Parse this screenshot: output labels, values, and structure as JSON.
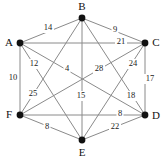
{
  "figure": {
    "type": "weighted-complete-graph",
    "vertex_count": 6,
    "edge_count": 15,
    "background_color": "#ffffff",
    "edge_color": "#8a8a8a",
    "node_color": "#111111",
    "label_color": "#1a1a1a"
  },
  "vertices": [
    {
      "id": "A",
      "label": "A",
      "x": 20,
      "y": 43,
      "label_x": 9,
      "label_y": 43
    },
    {
      "id": "B",
      "label": "B",
      "x": 82,
      "y": 18,
      "label_x": 82,
      "label_y": 7
    },
    {
      "id": "C",
      "label": "C",
      "x": 145,
      "y": 43,
      "label_x": 156,
      "label_y": 43
    },
    {
      "id": "D",
      "label": "D",
      "x": 145,
      "y": 115,
      "label_x": 156,
      "label_y": 116
    },
    {
      "id": "E",
      "label": "E",
      "x": 82,
      "y": 140,
      "label_x": 82,
      "label_y": 153
    },
    {
      "id": "F",
      "label": "F",
      "x": 20,
      "y": 115,
      "label_x": 9,
      "label_y": 115
    }
  ],
  "edges": [
    {
      "from": "A",
      "to": "B",
      "weight": "14",
      "label_x": 48,
      "label_y": 28
    },
    {
      "from": "B",
      "to": "C",
      "weight": "9",
      "label_x": 115,
      "label_y": 30
    },
    {
      "from": "A",
      "to": "C",
      "weight": "21",
      "label_x": 121,
      "label_y": 42
    },
    {
      "from": "A",
      "to": "F",
      "weight": "10",
      "label_x": 13,
      "label_y": 78
    },
    {
      "from": "C",
      "to": "D",
      "weight": "17",
      "label_x": 150,
      "label_y": 79
    },
    {
      "from": "F",
      "to": "D",
      "weight": "8",
      "label_x": 120,
      "label_y": 114
    },
    {
      "from": "F",
      "to": "E",
      "weight": "8",
      "label_x": 47,
      "label_y": 127
    },
    {
      "from": "E",
      "to": "D",
      "weight": "22",
      "label_x": 115,
      "label_y": 127
    },
    {
      "from": "B",
      "to": "E",
      "weight": "15",
      "label_x": 81,
      "label_y": 96
    },
    {
      "from": "A",
      "to": "D",
      "weight": "12",
      "label_x": 34,
      "label_y": 64
    },
    {
      "from": "A",
      "to": "E",
      "weight": "25",
      "label_x": 33,
      "label_y": 94
    },
    {
      "from": "B",
      "to": "F",
      "weight": "4",
      "label_x": 67,
      "label_y": 69
    },
    {
      "from": "B",
      "to": "D",
      "weight": "28",
      "label_x": 99,
      "label_y": 69
    },
    {
      "from": "C",
      "to": "F",
      "weight": "24",
      "label_x": 133,
      "label_y": 64
    },
    {
      "from": "C",
      "to": "E",
      "weight": "18",
      "label_x": 131,
      "label_y": 96
    }
  ]
}
